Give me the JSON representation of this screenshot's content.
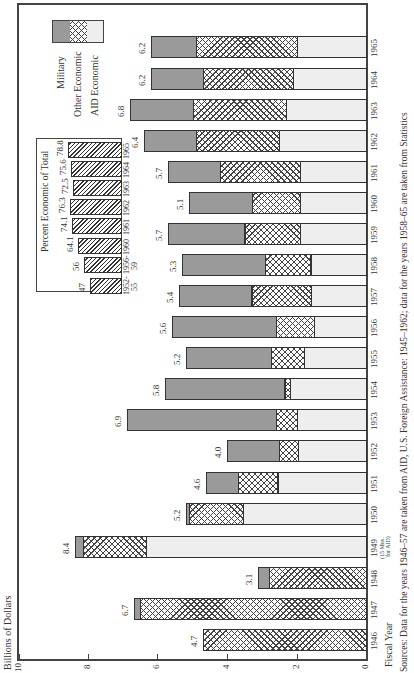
{
  "chart_data": {
    "type": "bar",
    "orientation": "stacked bar chart printed rotated 90 degrees (value axis along bottom, years bottom-to-top)",
    "title": "",
    "ylabel": "Billions of Dollars",
    "xlabel": "Fiscal Year",
    "ylim": [
      0,
      10
    ],
    "yticks": [
      "0",
      "2",
      "4",
      "6",
      "8",
      "10"
    ],
    "categories": [
      "1946",
      "1947",
      "1948",
      "1949",
      "1950",
      "1951",
      "1952",
      "1953",
      "1954",
      "1955",
      "1956",
      "1957",
      "1958",
      "1959",
      "1960",
      "1961",
      "1962",
      "1963",
      "1964",
      "1965"
    ],
    "category_notes": {
      "1949": "(15 Mos. for AID)"
    },
    "series": [
      {
        "name": "AID Economic",
        "values": [
          0,
          0,
          0,
          6.35,
          3.55,
          2.55,
          1.95,
          2.0,
          2.2,
          1.8,
          1.5,
          1.6,
          1.6,
          1.9,
          1.9,
          1.9,
          2.5,
          2.3,
          2.1,
          2.0
        ]
      },
      {
        "name": "Other Economic",
        "values": [
          4.7,
          6.5,
          2.8,
          1.8,
          1.55,
          1.15,
          0.55,
          0.6,
          0.15,
          0.95,
          1.1,
          1.7,
          1.3,
          1.6,
          1.4,
          2.3,
          2.4,
          2.7,
          2.6,
          2.9
        ]
      },
      {
        "name": "Military",
        "values": [
          0,
          0.2,
          0.3,
          0.25,
          0.1,
          0.9,
          1.5,
          4.3,
          3.45,
          2.45,
          3.0,
          2.1,
          2.4,
          2.2,
          1.8,
          1.5,
          1.5,
          1.8,
          1.5,
          1.3
        ]
      }
    ],
    "totals": [
      "4.7",
      "6.7",
      "3.1",
      "8.4",
      "5.2",
      "4.6",
      "4.0",
      "6.9",
      "5.8",
      "5.2",
      "5.6",
      "5.4",
      "5.3",
      "5.7",
      "5.1",
      "5.7",
      "6.4",
      "6.8",
      "6.2",
      "6.2"
    ],
    "legend": [
      "Military",
      "Other Economic",
      "AID Economic"
    ],
    "legend_position": "upper-left (rotated)",
    "grid": false,
    "inset": {
      "title": "Percent Economic of Total",
      "type": "bar",
      "categories": [
        "1952-55",
        "1956-59",
        "1960",
        "1961",
        "1962",
        "1963",
        "1964",
        "1965"
      ],
      "values": [
        47,
        56,
        64.1,
        74.1,
        76.3,
        72.5,
        75.6,
        78.8
      ],
      "value_labels": [
        "47",
        "56",
        "64.1",
        "74.1",
        "76.3",
        "72.5",
        "75.6",
        "78.8"
      ]
    },
    "source_note": "Sources: Data for the years 1946–57 are taken from AID, U.S. Foreign Assistance: 1945–1962; data for the years 1958–65 are taken from Statistics"
  },
  "axis": {
    "ylabel": "Billions of Dollars",
    "xlabel": "Fiscal Year",
    "ticks": [
      {
        "label": "10",
        "x": 19
      },
      {
        "label": "8",
        "x": 88
      },
      {
        "label": "6",
        "x": 157
      },
      {
        "label": "4",
        "x": 227
      },
      {
        "label": "2",
        "x": 297
      },
      {
        "label": "0",
        "x": 366
      }
    ]
  },
  "legend": {
    "military": "Military",
    "other": "Other Economic",
    "aid": "AID Economic"
  },
  "inset": {
    "title": "Percent Economic of Total",
    "bars": [
      {
        "year1": "1952-",
        "year2": "55",
        "label": "47"
      },
      {
        "year1": "1956-",
        "year2": "59",
        "label": "56"
      },
      {
        "year1": "1960",
        "year2": "",
        "label": "64.1"
      },
      {
        "year1": "1961",
        "year2": "",
        "label": "74.1"
      },
      {
        "year1": "1962",
        "year2": "",
        "label": "76.3"
      },
      {
        "year1": "1963",
        "year2": "",
        "label": "72.5"
      },
      {
        "year1": "1964",
        "year2": "",
        "label": "75.6"
      },
      {
        "year1": "1965",
        "year2": "",
        "label": "78.8"
      }
    ]
  },
  "bars": [
    {
      "year": "1946",
      "total": "4.7",
      "y": 640
    },
    {
      "year": "1947",
      "total": "6.7",
      "y": 609
    },
    {
      "year": "1948",
      "total": "3.1",
      "y": 578
    },
    {
      "year": "1949",
      "total": "8.4",
      "y": 547,
      "note1": "(15 Mos.",
      "note2": "for AID)"
    },
    {
      "year": "1950",
      "total": "5.2",
      "y": 514
    },
    {
      "year": "1951",
      "total": "4.6",
      "y": 483
    },
    {
      "year": "1952",
      "total": "4.0",
      "y": 451
    },
    {
      "year": "1953",
      "total": "6.9",
      "y": 420
    },
    {
      "year": "1954",
      "total": "5.8",
      "y": 389
    },
    {
      "year": "1955",
      "total": "5.2",
      "y": 358
    },
    {
      "year": "1956",
      "total": "5.6",
      "y": 327
    },
    {
      "year": "1957",
      "total": "5.4",
      "y": 296
    },
    {
      "year": "1958",
      "total": "5.3",
      "y": 265
    },
    {
      "year": "1959",
      "total": "5.7",
      "y": 234
    },
    {
      "year": "1960",
      "total": "5.1",
      "y": 203
    },
    {
      "year": "1961",
      "total": "5.7",
      "y": 172
    },
    {
      "year": "1962",
      "total": "6.4",
      "y": 141
    },
    {
      "year": "1963",
      "total": "6.8",
      "y": 110
    },
    {
      "year": "1964",
      "total": "6.2",
      "y": 79
    },
    {
      "year": "1965",
      "total": "6.2",
      "y": 47
    }
  ],
  "source": "Sources: Data for the years 1946–57 are taken from AID, U.S. Foreign Assistance: 1945–1962; data for the years 1958–65 are taken from Statistics"
}
